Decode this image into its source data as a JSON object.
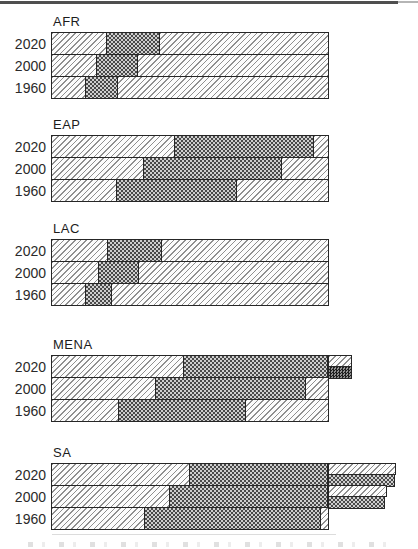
{
  "figure": {
    "background": "#ffffff",
    "border_rule_color": "#4f4f4f",
    "text_color": "#1c1c1c"
  },
  "chart_data": {
    "type": "bar",
    "orientation": "horizontal",
    "stacked": true,
    "title": "",
    "xlabel": "",
    "ylabel": "",
    "legend": "none visible",
    "axis": {
      "min": 0,
      "max": 100,
      "ticks_visible": false,
      "unit": "share of full bar span (no numeric scale printed)"
    },
    "years_order": [
      "2020",
      "2000",
      "1960"
    ],
    "patterns": {
      "light": {
        "name": "light-diagonal-hatch",
        "line": "#8f8f8f",
        "bg": "#fcfcfc"
      },
      "dark": {
        "name": "dark-crosshatch-weave",
        "fg": "#4a4a4a",
        "bg": "#cfcfcf"
      },
      "darkest": {
        "name": "extra-dark-crosshatch",
        "fg": "#1f1f1f",
        "bg": "#8f8f8f"
      }
    },
    "regions": [
      {
        "name": "AFR",
        "rows": [
          {
            "year": "2020",
            "segments": [
              {
                "pattern": "light",
                "x0": 0,
                "x1": 19.7
              },
              {
                "pattern": "dark",
                "x0": 19.7,
                "x1": 39.1
              },
              {
                "pattern": "light",
                "x0": 39.1,
                "x1": 100
              }
            ]
          },
          {
            "year": "2000",
            "segments": [
              {
                "pattern": "light",
                "x0": 0,
                "x1": 15.8
              },
              {
                "pattern": "dark",
                "x0": 15.8,
                "x1": 31.2
              },
              {
                "pattern": "light",
                "x0": 31.2,
                "x1": 100
              }
            ]
          },
          {
            "year": "1960",
            "segments": [
              {
                "pattern": "light",
                "x0": 0,
                "x1": 11.8
              },
              {
                "pattern": "dark",
                "x0": 11.8,
                "x1": 24.0
              },
              {
                "pattern": "light",
                "x0": 24.0,
                "x1": 100
              }
            ]
          }
        ]
      },
      {
        "name": "EAP",
        "rows": [
          {
            "year": "2020",
            "segments": [
              {
                "pattern": "light",
                "x0": 0,
                "x1": 44.1
              },
              {
                "pattern": "dark",
                "x0": 44.1,
                "x1": 95.0
              },
              {
                "pattern": "light",
                "x0": 95.0,
                "x1": 100
              }
            ]
          },
          {
            "year": "2000",
            "segments": [
              {
                "pattern": "light",
                "x0": 0,
                "x1": 33.0
              },
              {
                "pattern": "dark",
                "x0": 33.0,
                "x1": 83.5
              },
              {
                "pattern": "light",
                "x0": 83.5,
                "x1": 100
              }
            ]
          },
          {
            "year": "1960",
            "segments": [
              {
                "pattern": "light",
                "x0": 0,
                "x1": 23.3
              },
              {
                "pattern": "dark",
                "x0": 23.3,
                "x1": 67.0
              },
              {
                "pattern": "light",
                "x0": 67.0,
                "x1": 100
              }
            ]
          }
        ]
      },
      {
        "name": "LAC",
        "rows": [
          {
            "year": "2020",
            "segments": [
              {
                "pattern": "light",
                "x0": 0,
                "x1": 20.1
              },
              {
                "pattern": "dark",
                "x0": 20.1,
                "x1": 39.8
              },
              {
                "pattern": "light",
                "x0": 39.8,
                "x1": 100
              }
            ]
          },
          {
            "year": "2000",
            "segments": [
              {
                "pattern": "light",
                "x0": 0,
                "x1": 16.5
              },
              {
                "pattern": "dark",
                "x0": 16.5,
                "x1": 31.5
              },
              {
                "pattern": "light",
                "x0": 31.5,
                "x1": 100
              }
            ]
          },
          {
            "year": "1960",
            "segments": [
              {
                "pattern": "light",
                "x0": 0,
                "x1": 11.8
              },
              {
                "pattern": "dark",
                "x0": 11.8,
                "x1": 21.9
              },
              {
                "pattern": "light",
                "x0": 21.9,
                "x1": 100
              }
            ]
          }
        ]
      },
      {
        "name": "MENA",
        "rows": [
          {
            "year": "2020",
            "segments": [
              {
                "pattern": "light",
                "x0": 0,
                "x1": 47.3
              },
              {
                "pattern": "dark",
                "x0": 47.3,
                "x1": 100
              },
              {
                "pattern": "light",
                "x0": 100,
                "x1": 108.6,
                "half": "top"
              },
              {
                "pattern": "darkest",
                "x0": 100,
                "x1": 108.6,
                "half": "bottom"
              }
            ]
          },
          {
            "year": "2000",
            "segments": [
              {
                "pattern": "light",
                "x0": 0,
                "x1": 37.3
              },
              {
                "pattern": "dark",
                "x0": 37.3,
                "x1": 92.1
              },
              {
                "pattern": "light",
                "x0": 92.1,
                "x1": 100
              }
            ]
          },
          {
            "year": "1960",
            "segments": [
              {
                "pattern": "light",
                "x0": 0,
                "x1": 24.0
              },
              {
                "pattern": "dark",
                "x0": 24.0,
                "x1": 70.3
              },
              {
                "pattern": "light",
                "x0": 70.3,
                "x1": 100
              }
            ]
          }
        ]
      },
      {
        "name": "SA",
        "rows": [
          {
            "year": "2020",
            "segments": [
              {
                "pattern": "light",
                "x0": 0,
                "x1": 49.5
              },
              {
                "pattern": "dark",
                "x0": 49.5,
                "x1": 100
              },
              {
                "pattern": "light",
                "x0": 100,
                "x1": 124.7,
                "half": "top"
              },
              {
                "pattern": "dark",
                "x0": 100,
                "x1": 124.4,
                "half": "bottom"
              }
            ]
          },
          {
            "year": "2000",
            "segments": [
              {
                "pattern": "light",
                "x0": 0,
                "x1": 42.3
              },
              {
                "pattern": "dark",
                "x0": 42.3,
                "x1": 100
              },
              {
                "pattern": "light",
                "x0": 100,
                "x1": 121.5,
                "half": "top"
              },
              {
                "pattern": "dark",
                "x0": 100,
                "x1": 120.8,
                "half": "bottom"
              }
            ]
          },
          {
            "year": "1960",
            "segments": [
              {
                "pattern": "light",
                "x0": 0,
                "x1": 33.3
              },
              {
                "pattern": "dark",
                "x0": 33.3,
                "x1": 97.5
              },
              {
                "pattern": "light",
                "x0": 97.5,
                "x1": 100
              }
            ]
          }
        ]
      }
    ]
  }
}
